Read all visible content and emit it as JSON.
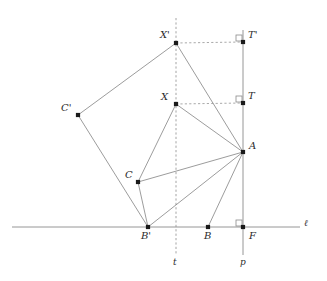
{
  "figure": {
    "kind": "geometry-construction",
    "width": 327,
    "height": 281,
    "background": "#ffffff",
    "stroke_color": "#8a8a8a",
    "dash_color": "#9a9a9a",
    "point_color": "#1a1a1a",
    "label_color": "#2b2b2b"
  },
  "points": [
    {
      "id": "Xprime",
      "label": "X'",
      "x": 176,
      "y": 43,
      "label_dx": -16,
      "label_dy": -13
    },
    {
      "id": "Tprime",
      "label": "T'",
      "x": 243,
      "y": 42,
      "label_dx": 5,
      "label_dy": -12
    },
    {
      "id": "X",
      "label": "X",
      "x": 176,
      "y": 104,
      "label_dx": -15,
      "label_dy": -12
    },
    {
      "id": "T",
      "label": "T",
      "x": 243,
      "y": 103,
      "label_dx": 5,
      "label_dy": -12
    },
    {
      "id": "A",
      "label": "A",
      "x": 243,
      "y": 152,
      "label_dx": 6,
      "label_dy": -11
    },
    {
      "id": "Cprime",
      "label": "C'",
      "x": 78,
      "y": 115,
      "label_dx": -17,
      "label_dy": -12
    },
    {
      "id": "C",
      "label": "C",
      "x": 138,
      "y": 182,
      "label_dx": -13,
      "label_dy": -12
    },
    {
      "id": "Bprime",
      "label": "B'",
      "x": 148,
      "y": 227,
      "label_dx": -7,
      "label_dy": 4
    },
    {
      "id": "B",
      "label": "B",
      "x": 208,
      "y": 227,
      "label_dx": -4,
      "label_dy": 4
    },
    {
      "id": "F",
      "label": "F",
      "x": 243,
      "y": 227,
      "label_dx": 6,
      "label_dy": 4
    }
  ],
  "lines": [
    {
      "id": "ell",
      "label": "ℓ",
      "kind": "solid",
      "orientation": "horizontal",
      "x1": 12,
      "y1": 227,
      "x2": 300,
      "y2": 227,
      "label_x": 304,
      "label_y": 219
    },
    {
      "id": "t",
      "label": "t",
      "kind": "dashed",
      "orientation": "vertical",
      "x1": 176,
      "y1": 18,
      "x2": 176,
      "y2": 255,
      "label_x": 173,
      "label_y": 258
    },
    {
      "id": "p",
      "label": "p",
      "kind": "solid",
      "orientation": "vertical",
      "x1": 243,
      "y1": 30,
      "x2": 243,
      "y2": 255,
      "label_x": 240,
      "label_y": 258
    }
  ],
  "segments": [
    {
      "id": "Xprime-Cprime",
      "from": "Xprime",
      "to": "Cprime",
      "kind": "solid"
    },
    {
      "id": "Xprime-A",
      "from": "Xprime",
      "to": "A",
      "kind": "solid"
    },
    {
      "id": "Cprime-Bprime",
      "from": "Cprime",
      "to": "Bprime",
      "kind": "solid"
    },
    {
      "id": "X-C",
      "from": "X",
      "to": "C",
      "kind": "solid"
    },
    {
      "id": "X-A",
      "from": "X",
      "to": "A",
      "kind": "solid"
    },
    {
      "id": "C-Bprime",
      "from": "C",
      "to": "Bprime",
      "kind": "solid"
    },
    {
      "id": "C-A",
      "from": "C",
      "to": "A",
      "kind": "solid"
    },
    {
      "id": "Bprime-A",
      "from": "Bprime",
      "to": "A",
      "kind": "solid"
    },
    {
      "id": "B-A",
      "from": "B",
      "to": "A",
      "kind": "solid"
    },
    {
      "id": "Xprime-Tprime",
      "from": "Xprime",
      "to": "Tprime",
      "kind": "dashed"
    },
    {
      "id": "X-T",
      "from": "X",
      "to": "T",
      "kind": "dashed"
    }
  ],
  "right_angles": [
    {
      "id": "right-angle-Tprime",
      "at": "Tprime",
      "x": 236,
      "y": 35,
      "size": 6
    },
    {
      "id": "right-angle-T",
      "at": "T",
      "x": 236,
      "y": 96,
      "size": 6
    },
    {
      "id": "right-angle-F",
      "at": "F",
      "x": 236,
      "y": 220,
      "size": 6
    }
  ]
}
